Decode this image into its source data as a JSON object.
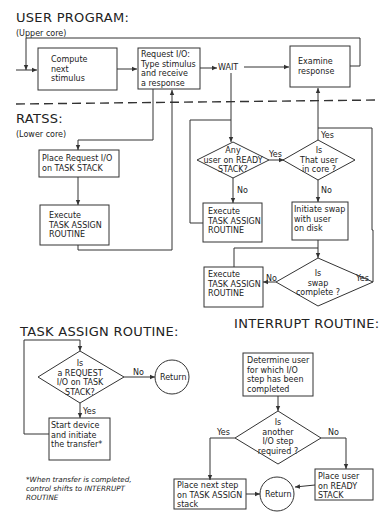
{
  "sections": {
    "user_program": {
      "title": "USER PROGRAM:",
      "subtitle": "(Upper core)"
    },
    "ratss": {
      "title": "RATSS:",
      "subtitle": "(Lower core)"
    },
    "task_assign": {
      "title": "TASK ASSIGN ROUTINE:"
    },
    "interrupt": {
      "title": "INTERRUPT ROUTINE:"
    }
  },
  "user_program": {
    "compute": "Compute\nnext\nstimulus",
    "request": "Request I/O:\nType stimulus\nand receive\na response",
    "wait": "WAIT",
    "examine": "Examine\nresponse"
  },
  "ratss": {
    "place_request": "Place Request I/O\non TASK STACK",
    "execute1": "Execute\nTASK ASSIGN\nROUTINE",
    "any_user": "Any\nuser on READY\nSTACK?",
    "is_in_core": "Is\nThat user\nin core ?",
    "execute2": "Execute\nTASK ASSIGN\nROUTINE",
    "initiate_swap": "Initiate swap\nwith user\non disk",
    "execute3": "Execute\nTASK ASSIGN\nROUTINE",
    "swap_complete": "Is\nswap\ncomplete ?",
    "yes": "Yes",
    "no": "No"
  },
  "task_assign": {
    "decision": "Is\na REQUEST\nI/O on TASK\nSTACK?",
    "return": "Return",
    "start": "Start device\nand initiate\nthe transfer*",
    "yes": "Yes",
    "no": "No",
    "footnote": "*When transfer is completed,\ncontrol shifts to INTERRUPT\nROUTINE"
  },
  "interrupt": {
    "determine": "Determine user\nfor which I/O\nstep has been\ncompleted",
    "decision": "Is\nanother\nI/O step\nrequired ?",
    "place_next": "Place next step\non TASK ASSIGN\nstack",
    "return": "Return",
    "place_user": "Place user\non READY\nSTACK",
    "yes": "Yes",
    "no": "No"
  }
}
